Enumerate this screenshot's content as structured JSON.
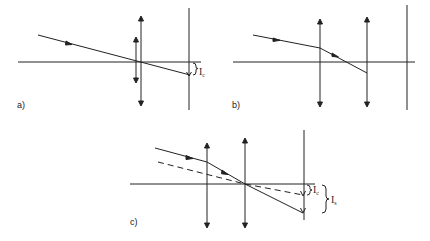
{
  "figure": {
    "panels": [
      {
        "id": "a",
        "label": "a)",
        "description": "Single thin lens pair on axis; ray passes through lens center and hits screen below axis",
        "annotations": [
          {
            "symbol": "I",
            "subscript": "c"
          }
        ]
      },
      {
        "id": "b",
        "label": "b)",
        "description": "Two separated lenses; ray refracted at first lens, crosses axis, ends at second lens",
        "annotations": []
      },
      {
        "id": "c",
        "label": "c)",
        "description": "Two lenses; solid ray and dashed ray both cross axis at second lens and reach screen; displacements marked",
        "annotations": [
          {
            "symbol": "I",
            "subscript": "c"
          },
          {
            "symbol": "I",
            "subscript": "s"
          }
        ]
      }
    ],
    "colors": {
      "line": "#222222",
      "background": "#ffffff"
    }
  }
}
